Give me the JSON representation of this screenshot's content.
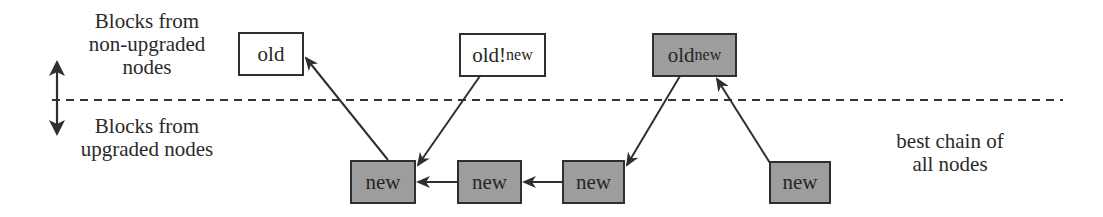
{
  "legend": {
    "top_label_lines": [
      "Blocks from",
      "non-upgraded",
      "nodes"
    ],
    "bottom_label_lines": [
      "Blocks from",
      "upgraded nodes"
    ],
    "separator_icon": "double-headed-vertical-arrow"
  },
  "annotation": {
    "lines": [
      "best chain of",
      "all nodes"
    ]
  },
  "colors": {
    "upgraded_block_fill": "#9d9d9d",
    "non_upgraded_block_fill": "#ffffff",
    "stroke": "#2f2f2f"
  },
  "blocks": {
    "old": {
      "label": "old",
      "fill": "white",
      "row": "non-upgraded"
    },
    "old_not_new": {
      "label_main": "old!",
      "label_small": "new",
      "fill": "white",
      "row": "non-upgraded"
    },
    "oldnew": {
      "label_main": "old",
      "label_small": "new",
      "fill": "gray",
      "row": "non-upgraded"
    },
    "new1": {
      "label": "new",
      "fill": "gray",
      "row": "upgraded"
    },
    "new2": {
      "label": "new",
      "fill": "gray",
      "row": "upgraded"
    },
    "new3": {
      "label": "new",
      "fill": "gray",
      "row": "upgraded"
    },
    "new4": {
      "label": "new",
      "fill": "gray",
      "row": "upgraded"
    }
  },
  "edges": [
    {
      "from": "new1",
      "to": "old"
    },
    {
      "from": "old_not_new",
      "to": "new1"
    },
    {
      "from": "new2",
      "to": "new1"
    },
    {
      "from": "new3",
      "to": "new2"
    },
    {
      "from": "oldnew",
      "to": "new3"
    },
    {
      "from": "new4",
      "to": "oldnew"
    }
  ]
}
